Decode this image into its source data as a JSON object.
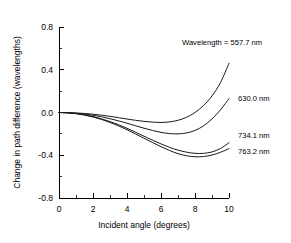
{
  "chart_data": {
    "type": "line",
    "title": "",
    "xlabel": "Incident angle (degrees)",
    "ylabel": "Change in path difference (wavelengths)",
    "xlim": [
      0,
      10
    ],
    "ylim": [
      -0.8,
      0.8
    ],
    "xticks": [
      "0",
      "2",
      "4",
      "6",
      "8",
      "10"
    ],
    "xtick_values": [
      0,
      2,
      4,
      6,
      8,
      10
    ],
    "yticks": [
      "0.8",
      "0.4",
      "0.0",
      "-0.4",
      "-0.8"
    ],
    "ytick_values": [
      0.8,
      0.4,
      0.0,
      -0.4,
      -0.8
    ],
    "minor_ticks": true,
    "grid": false,
    "legend_position": "inline-right-annotations",
    "x": [
      0,
      0.5,
      1,
      1.5,
      2,
      2.5,
      3,
      3.5,
      4,
      4.5,
      5,
      5.5,
      6,
      6.5,
      7,
      7.5,
      8,
      8.5,
      9,
      9.5,
      10
    ],
    "series": [
      {
        "name": "557.7 nm",
        "label": "Wavelength = 557.7 nm",
        "values": [
          0.0,
          -0.001,
          -0.004,
          -0.009,
          -0.016,
          -0.025,
          -0.036,
          -0.048,
          -0.061,
          -0.073,
          -0.083,
          -0.09,
          -0.093,
          -0.088,
          -0.073,
          -0.045,
          0.0,
          0.065,
          0.155,
          0.28,
          0.46
        ]
      },
      {
        "name": "630.0 nm",
        "label": "630.0 nm",
        "values": [
          0.0,
          -0.002,
          -0.007,
          -0.015,
          -0.026,
          -0.04,
          -0.058,
          -0.078,
          -0.1,
          -0.124,
          -0.147,
          -0.168,
          -0.186,
          -0.197,
          -0.2,
          -0.191,
          -0.168,
          -0.125,
          -0.06,
          0.025,
          0.13
        ]
      },
      {
        "name": "734.1 nm",
        "label": "734.1 nm",
        "values": [
          0.0,
          -0.003,
          -0.01,
          -0.022,
          -0.038,
          -0.059,
          -0.085,
          -0.114,
          -0.148,
          -0.184,
          -0.222,
          -0.259,
          -0.294,
          -0.326,
          -0.352,
          -0.371,
          -0.382,
          -0.382,
          -0.369,
          -0.337,
          -0.282
        ]
      },
      {
        "name": "763.2 nm",
        "label": "763.2 nm",
        "values": [
          0.0,
          -0.003,
          -0.011,
          -0.024,
          -0.042,
          -0.065,
          -0.093,
          -0.125,
          -0.161,
          -0.2,
          -0.241,
          -0.281,
          -0.32,
          -0.355,
          -0.385,
          -0.405,
          -0.414,
          -0.412,
          -0.398,
          -0.372,
          -0.338
        ]
      }
    ],
    "annotations": [
      {
        "text": "Wavelength = 557.7 nm",
        "x_px": 182,
        "y_px": 42
      },
      {
        "text": "630.0 nm",
        "x_px": 237,
        "y_px": 98
      },
      {
        "text": "734.1 nm",
        "x_px": 237,
        "y_px": 135
      },
      {
        "text": "763.2 nm",
        "x_px": 237,
        "y_px": 151
      }
    ],
    "colors": {
      "curve": "#1a1a1a",
      "axis": "#000000",
      "background": "#ffffff"
    }
  }
}
